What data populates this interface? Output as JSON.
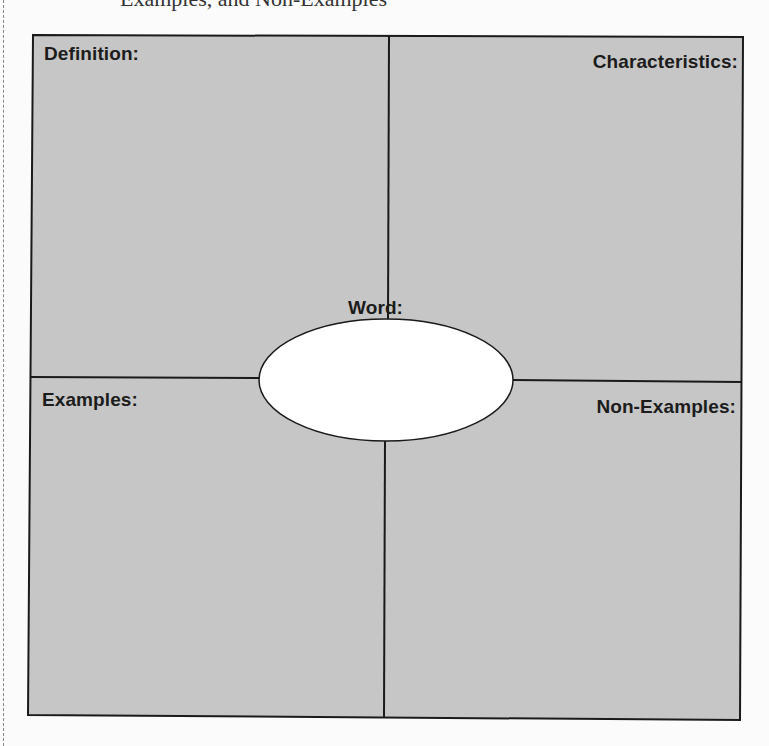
{
  "page": {
    "cropped_heading": "Examples, and Non-Examples"
  },
  "frayer_model": {
    "quadrants": {
      "top_left": {
        "label": "Definition:"
      },
      "top_right": {
        "label": "Characteristics:"
      },
      "bottom_left": {
        "label": "Examples:"
      },
      "bottom_right": {
        "label": "Non-Examples:"
      }
    },
    "center": {
      "label": "Word:"
    },
    "colors": {
      "quadrant_fill": "#c6c6c6",
      "center_fill": "#ffffff",
      "stroke": "#1a1a1a",
      "page_background": "#fbfbfb"
    }
  }
}
